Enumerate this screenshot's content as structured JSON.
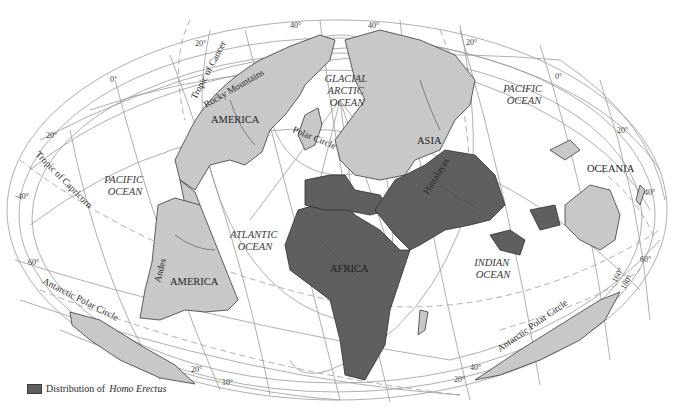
{
  "map": {
    "projection": "oblique equal-area (Hammer/Aitoff style)",
    "colors": {
      "homo_erectus_region": "#5f5f5f",
      "other_land": "#c8c8c8",
      "ocean": "#ffffff",
      "graticule": "#9a9a9a"
    },
    "continents": {
      "north_america": "AMERICA",
      "south_america": "AMERICA",
      "asia": "ASIA",
      "africa": "AFRICA",
      "oceania": "OCEANIA"
    },
    "oceans": {
      "arctic_line1": "GLACIAL",
      "arctic_line2": "ARCTIC",
      "arctic_line3": "OCEAN",
      "pacific_left_line1": "PACIFIC",
      "pacific_left_line2": "OCEAN",
      "pacific_right_line1": "PACIFIC",
      "pacific_right_line2": "OCEAN",
      "atlantic_line1": "ATLANTIC",
      "atlantic_line2": "OCEAN",
      "indian_line1": "INDIAN",
      "indian_line2": "OCEAN"
    },
    "features": {
      "rocky": "Rocky Mountains",
      "andes": "Andes",
      "himalayas": "Himalayas"
    },
    "lines": {
      "tropic_cancer": "Tropic of Cancer",
      "tropic_capricorn": "Tropic of Capricorn",
      "polar_circle": "Polar Circle",
      "antarctic_left": "Antarctic Polar Circle",
      "antarctic_right": "Antarctic Polar Circle"
    },
    "degree_labels": {
      "d40_top_left": "40°",
      "d40_top_right": "40°",
      "d20_top_left": "20°",
      "d20_top_right": "20°",
      "d0_left": "0°",
      "d0_right": "0°",
      "d20_left": "20°",
      "d40_left": "-40°",
      "d60_left": "60°",
      "d20_right": "20°",
      "d40_right": "40°",
      "d60_right": "60°",
      "d160": "160°",
      "d180": "180°",
      "d20_bottom_left": "20°",
      "d10_bottom": "10°",
      "d40_bottom_right": "40°",
      "d20_bottom_right": "20°"
    }
  },
  "legend": {
    "label_prefix": "Distribution of",
    "label_species": "Homo Erectus"
  }
}
